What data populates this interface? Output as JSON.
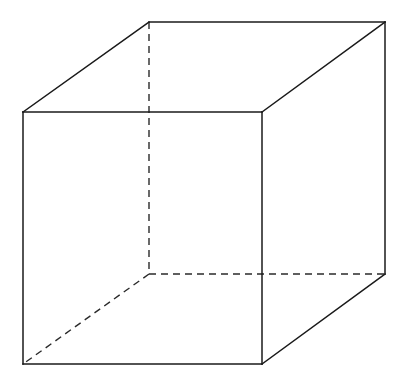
{
  "diagram": {
    "type": "wireframe-cube",
    "background": "#ffffff",
    "line_color": "#1a1a1a",
    "vertices": {
      "front_top_left": [
        23,
        112
      ],
      "front_top_right": [
        262,
        112
      ],
      "front_bottom_left": [
        23,
        364
      ],
      "front_bottom_right": [
        262,
        364
      ],
      "back_top_left": [
        149,
        22
      ],
      "back_top_right": [
        385,
        22
      ],
      "back_bottom_right": [
        385,
        274
      ],
      "back_bottom_left_hidden": [
        149,
        274
      ]
    },
    "visible_edges": [
      [
        "front_top_left",
        "front_top_right"
      ],
      [
        "front_top_right",
        "front_bottom_right"
      ],
      [
        "front_bottom_right",
        "front_bottom_left"
      ],
      [
        "front_bottom_left",
        "front_top_left"
      ],
      [
        "front_top_left",
        "back_top_left"
      ],
      [
        "back_top_left",
        "back_top_right"
      ],
      [
        "front_top_right",
        "back_top_right"
      ],
      [
        "back_top_right",
        "back_bottom_right"
      ],
      [
        "front_bottom_right",
        "back_bottom_right"
      ]
    ],
    "hidden_edges": [
      [
        "back_top_left",
        "back_bottom_left_hidden"
      ],
      [
        "back_bottom_left_hidden",
        "back_bottom_right"
      ],
      [
        "back_bottom_left_hidden",
        "front_bottom_left"
      ]
    ]
  }
}
